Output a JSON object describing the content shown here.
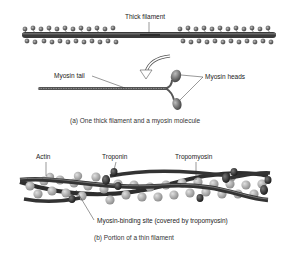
{
  "panel_a": {
    "labels": {
      "thick_filament": "Thick filament",
      "myosin_tail": "Myosin tail",
      "myosin_heads": "Myosin heads"
    },
    "caption": "(a) One thick filament and a myosin molecule"
  },
  "panel_b": {
    "labels": {
      "actin": "Actin",
      "troponin": "Troponin",
      "tropomyosin": "Tropomyosin",
      "myosin_binding_site": "Myosin-binding site (covered by tropomyosin)"
    },
    "caption": "(b) Portion of a thin filament"
  },
  "colors": {
    "filament_dark": "#3a3a3a",
    "head_gray": "#7a7a7a",
    "actin_bead": "#b5b5b5",
    "troponin_dark": "#2e2e2e"
  }
}
